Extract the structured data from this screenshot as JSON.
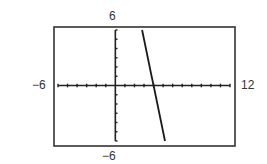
{
  "chart_data": {
    "type": "line",
    "title": "",
    "xlabel": "",
    "ylabel": "",
    "window": {
      "xmin": -6,
      "xmax": 12,
      "ymin": -6,
      "ymax": 6,
      "xscl": 1,
      "yscl": 1
    },
    "xlim": [
      -6,
      12
    ],
    "ylim": [
      -6,
      6
    ],
    "grid": false,
    "legend": null,
    "window_labels": {
      "top": "6",
      "left": "−6",
      "right": "12",
      "bottom": "−6"
    },
    "series": [
      {
        "name": "line",
        "equation_estimate": "y = -5x + 20",
        "x": [
          2.8,
          4,
          5.2
        ],
        "y": [
          6,
          0,
          -6
        ]
      }
    ],
    "x_intercept": 4
  },
  "colors": {
    "axis": "#222222",
    "line": "#1a1a1a",
    "frame": "#333333",
    "label": "#333333"
  }
}
